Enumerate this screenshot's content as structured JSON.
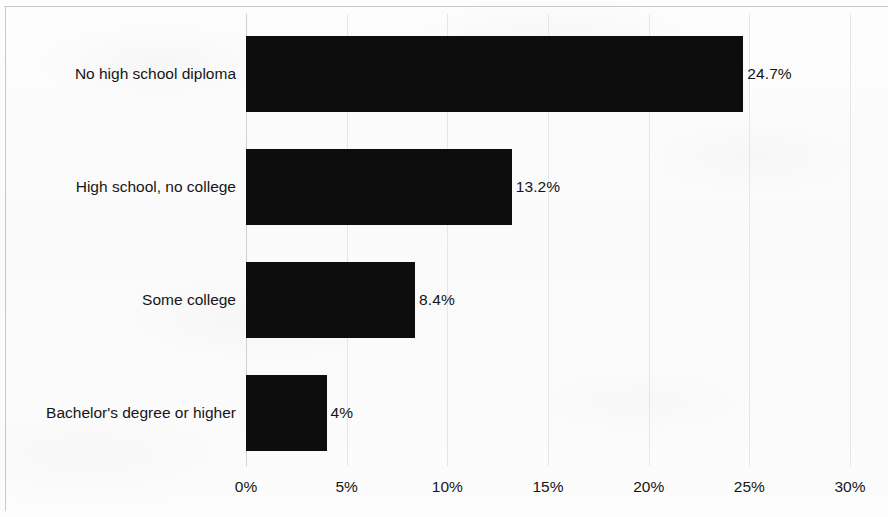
{
  "chart_data": {
    "type": "bar",
    "orientation": "horizontal",
    "title": "",
    "subtitle": "",
    "xlabel": "",
    "ylabel": "",
    "categories": [
      "No high school diploma",
      "High school, no college",
      "Some college",
      "Bachelor's degree or higher"
    ],
    "values": [
      24.7,
      13.2,
      8.4,
      4
    ],
    "value_labels": [
      "24.7%",
      "13.2%",
      "8.4%",
      "4%"
    ],
    "xlim": [
      0,
      30
    ],
    "xticks": [
      0,
      5,
      10,
      15,
      20,
      25,
      30
    ],
    "xtick_labels": [
      "0%",
      "5%",
      "10%",
      "15%",
      "20%",
      "25%",
      "30%"
    ],
    "grid": true,
    "grid_axis": "x",
    "legend": false,
    "bar_color": "#0d0d0d",
    "gridline_color": "#e6e6e6",
    "background_color": "#fbfbfb",
    "text_color": "#161616"
  }
}
